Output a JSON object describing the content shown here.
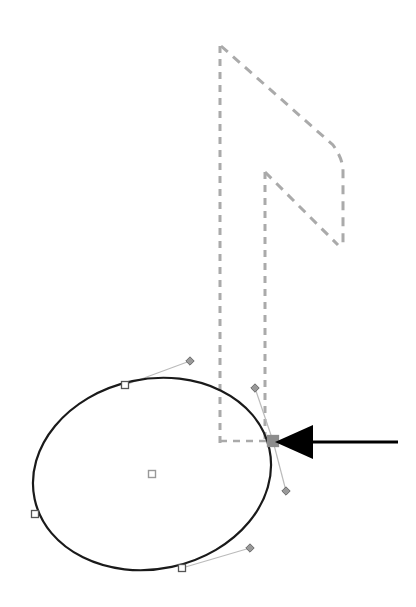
{
  "canvas": {
    "width": 416,
    "height": 607,
    "background_color": "#ffffff",
    "title": "Eighth note path editing view"
  },
  "colors": {
    "guide_dashed": "#aaaaaa",
    "path_stroke": "#1a1a1a",
    "anchor_fill": "#ffffff",
    "anchor_stroke": "#555555",
    "selected_anchor_fill": "#8c8c8c",
    "handle_fill": "#999999",
    "handle_line": "#bbbbbb",
    "center_marker": "#999999",
    "annotation_arrow": "#000000"
  },
  "guide_shape": {
    "name": "note-stem-and-flags",
    "style": "dashed-gray-outline",
    "description": "Dashed outline of a sixteenth-note stem with two flags",
    "stem": {
      "left_edge_x": 220,
      "right_edge_x": 265,
      "top_y": 46,
      "bottom_y": 443
    },
    "flag_upper": {
      "start": [
        221,
        46
      ],
      "peak": [
        343,
        167
      ],
      "end": [
        343,
        245
      ]
    },
    "flag_lower": {
      "start": [
        265,
        172
      ],
      "end": [
        338,
        245
      ]
    }
  },
  "edited_path": {
    "name": "note-head-ellipse",
    "type": "closed-bezier-ellipse",
    "stroke_color": "#1a1a1a",
    "stroke_width": 2,
    "fill": "none",
    "center": [
      152,
      474
    ],
    "radius_x": 120,
    "radius_y": 95,
    "rotation_deg": -12
  },
  "anchor_points": [
    {
      "id": "anchor-top",
      "x": 125,
      "y": 385,
      "selected": false,
      "shape": "square"
    },
    {
      "id": "anchor-left",
      "x": 35,
      "y": 514,
      "selected": false,
      "shape": "square"
    },
    {
      "id": "anchor-bottom",
      "x": 182,
      "y": 568,
      "selected": false,
      "shape": "square"
    },
    {
      "id": "anchor-right",
      "x": 273,
      "y": 441,
      "selected": true,
      "shape": "square"
    }
  ],
  "control_handles": [
    {
      "id": "handle-top-out",
      "anchor": [
        125,
        385
      ],
      "x": 190,
      "y": 361,
      "shape": "diamond"
    },
    {
      "id": "handle-bottom-out",
      "anchor": [
        182,
        568
      ],
      "x": 250,
      "y": 548,
      "shape": "diamond"
    },
    {
      "id": "handle-right-in",
      "anchor": [
        273,
        441
      ],
      "x": 255,
      "y": 388,
      "shape": "diamond"
    },
    {
      "id": "handle-right-out",
      "anchor": [
        273,
        441
      ],
      "x": 286,
      "y": 491,
      "shape": "diamond"
    }
  ],
  "center_marker": {
    "id": "path-center-marker",
    "x": 152,
    "y": 474,
    "size": 7
  },
  "annotation_arrow": {
    "id": "callout-arrow",
    "direction": "left",
    "tip": [
      275,
      442
    ],
    "tail": [
      398,
      442
    ],
    "head_length": 38,
    "head_half_height": 17,
    "shaft_thickness": 3,
    "color": "#000000",
    "points_at": "anchor-right"
  },
  "guide_connector": {
    "id": "stem-baseline-connector",
    "from": [
      220,
      441
    ],
    "to": [
      272,
      441
    ],
    "style": "dashed"
  }
}
